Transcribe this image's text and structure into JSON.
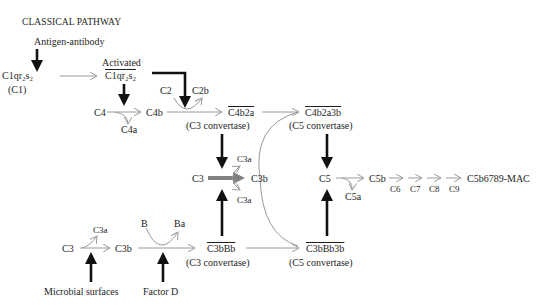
{
  "title": "CLASSICAL PATHWAY",
  "classical": {
    "trigger": "Antigen-antibody",
    "c1": "C1qr₂s₂",
    "c1_alias": "(C1)",
    "activated_label": "Activated",
    "activated_c1": "C1qr₂s₂",
    "c4": "C4",
    "c4a": "C4a",
    "c4b": "C4b",
    "c2": "C2",
    "c2b": "C2b",
    "c3_convertase": "C4b2a",
    "c3_convertase_label": "(C3 convertase)",
    "c5_convertase": "C4b2a3b",
    "c5_convertase_label": "(C5 convertase)"
  },
  "central": {
    "c3": "C3",
    "c3a_top": "C3a",
    "c3a_bottom": "C3a",
    "c3b": "C3b",
    "c5": "C5",
    "c5a": "C5a",
    "c5b": "C5b",
    "c6": "C6",
    "c7": "C7",
    "c8": "C8",
    "c9": "C9",
    "mac": "C5b6789-MAC"
  },
  "alternative": {
    "c3": "C3",
    "c3a": "C3a",
    "c3b": "C3b",
    "b": "B",
    "ba": "Ba",
    "trigger_surfaces": "Microbial surfaces",
    "trigger_factor": "Factor D",
    "c3_convertase": "C3bBb",
    "c3_convertase_label": "(C3 convertase)",
    "c5_convertase": "C3bBb3b",
    "c5_convertase_label": "(C5 convertase)"
  },
  "colors": {
    "thin_arrow": "#9a9a9a",
    "thick_arrow": "#111111",
    "main_arrow": "#808080",
    "text": "#1e1e1e"
  }
}
